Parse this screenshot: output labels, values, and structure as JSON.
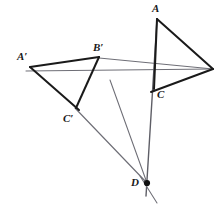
{
  "figure": {
    "type": "geometry-diagram",
    "width": 220,
    "height": 209,
    "background_color": "#ffffff",
    "stroke_colors": {
      "triangle_edge": "#1a1a1a",
      "projection_line": "#6e6e76",
      "center_point": "#111111"
    },
    "stroke_widths": {
      "triangle_edge": 2.0,
      "projection_line": 1.0
    }
  },
  "points": {
    "A": {
      "label": "A",
      "x": 157,
      "y": 19,
      "label_x": 152,
      "label_y": 3
    },
    "B": {
      "label": "",
      "x": 212,
      "y": 68,
      "label_x": 214,
      "label_y": 60
    },
    "C": {
      "label": "C",
      "x": 155,
      "y": 88,
      "label_x": 157,
      "label_y": 89
    },
    "Ap": {
      "label": "A'",
      "x": 30,
      "y": 67,
      "label_x": 17,
      "label_y": 51
    },
    "Bp": {
      "label": "B'",
      "x": 99,
      "y": 57,
      "label_x": 93,
      "label_y": 42
    },
    "Cp": {
      "label": "C'",
      "x": 75,
      "y": 108,
      "label_x": 64,
      "label_y": 113
    },
    "D": {
      "label": "D",
      "x": 147,
      "y": 183,
      "label_x": 132,
      "label_y": 177
    },
    "E": {
      "label": "",
      "x": 110,
      "y": 80,
      "label_x": 0,
      "label_y": 0
    }
  },
  "labels": [
    {
      "name": "label-A",
      "text": "A",
      "x": 152,
      "y": 3
    },
    {
      "name": "label-C",
      "text": "C",
      "x": 157,
      "y": 89
    },
    {
      "name": "label-A-prime",
      "text": "A′",
      "x": 17,
      "y": 51
    },
    {
      "name": "label-B-prime",
      "text": "B′",
      "x": 93,
      "y": 42
    },
    {
      "name": "label-C-prime",
      "text": "C′",
      "x": 63,
      "y": 113
    },
    {
      "name": "label-D",
      "text": "D",
      "x": 131,
      "y": 177
    }
  ],
  "segments": {
    "triangle_abc": [
      {
        "name": "edge-A-B",
        "x1": 157,
        "y1": 19,
        "x2": 212,
        "y2": 68
      },
      {
        "name": "edge-B-C",
        "x1": 212,
        "y1": 68,
        "x2": 152,
        "y2": 91
      },
      {
        "name": "edge-A-C",
        "x1": 157,
        "y1": 19,
        "x2": 155,
        "y2": 88
      }
    ],
    "triangle_abc_prime": [
      {
        "name": "edge-Aprime-Bprime",
        "x1": 30,
        "y1": 67,
        "x2": 99,
        "y2": 57
      },
      {
        "name": "edge-Bprime-Cprime",
        "x1": 99,
        "y1": 57,
        "x2": 75,
        "y2": 108
      },
      {
        "name": "edge-Aprime-Cprime",
        "x1": 30,
        "y1": 67,
        "x2": 78,
        "y2": 110
      }
    ],
    "projection_lines": [
      {
        "name": "line-Bprime-B",
        "x1": 99,
        "y1": 58,
        "x2": 213,
        "y2": 69
      },
      {
        "name": "line-Cprime-B",
        "x1": 26,
        "y1": 71,
        "x2": 213,
        "y2": 69
      },
      {
        "name": "line-Cprime-D",
        "x1": 75,
        "y1": 108,
        "x2": 147,
        "y2": 183
      },
      {
        "name": "line-E-D",
        "x1": 110,
        "y1": 80,
        "x2": 147,
        "y2": 183
      },
      {
        "name": "line-A-D",
        "x1": 157,
        "y1": 19,
        "x2": 146,
        "y2": 196
      },
      {
        "name": "line-D-tail",
        "x1": 140,
        "y1": 176,
        "x2": 156,
        "y2": 202
      }
    ]
  },
  "center_of_perspective": {
    "name": "point-D",
    "x": 147,
    "y": 183,
    "radius": 3.1
  }
}
